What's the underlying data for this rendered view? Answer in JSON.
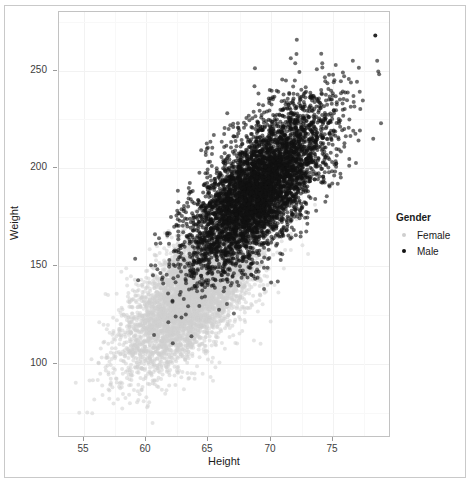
{
  "chart_data": {
    "type": "scatter",
    "title": "",
    "xlabel": "Height",
    "ylabel": "Weight",
    "xlim": [
      53.0,
      79.5
    ],
    "ylim": [
      63,
      280
    ],
    "xticks": [
      55,
      60,
      65,
      70,
      75
    ],
    "xtick_labels": [
      "55",
      "60",
      "65",
      "70",
      "75"
    ],
    "yticks": [
      100,
      150,
      200,
      250
    ],
    "ytick_labels": [
      "100",
      "150",
      "200",
      "250"
    ],
    "grid": true,
    "legend_position": "right",
    "legend_title": "Gender",
    "series": [
      {
        "name": "Female",
        "color": "#cfcfcf",
        "n_points": 5000,
        "x_mean": 63.7,
        "x_sd": 2.7,
        "y_mean": 135.0,
        "y_sd": 19.0,
        "correlation": 0.66,
        "point_size": 2.0,
        "opacity": 0.55
      },
      {
        "name": "Male",
        "color": "#111111",
        "n_points": 5000,
        "x_mean": 69.0,
        "x_sd": 2.8,
        "y_mean": 189.0,
        "y_sd": 21.0,
        "correlation": 0.67,
        "point_size": 2.0,
        "opacity": 0.62
      }
    ],
    "annotations": [
      {
        "label": "max-weight-outlier",
        "x": 78.4,
        "y": 268
      }
    ]
  },
  "axes": {
    "x_title": "Height",
    "y_title": "Weight"
  },
  "legend": {
    "title": "Gender",
    "items": [
      {
        "label": "Female",
        "color": "#cfcfcf"
      },
      {
        "label": "Male",
        "color": "#111111"
      }
    ]
  }
}
